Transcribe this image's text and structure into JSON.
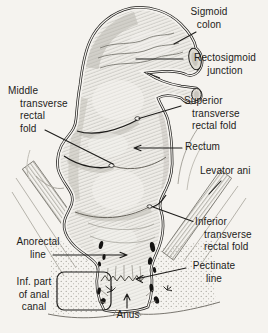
{
  "colors": {
    "background": "#f5f3ef",
    "ink": "#1d1c1a",
    "organ_fill": "#efede8",
    "shade": "#8b887f"
  },
  "labels": {
    "sigmoid_colon": "Sigmoid\ncolon",
    "rectosigmoid_junction": "Rectosigmoid\njunction",
    "middle_transverse_rectal_fold": "Middle\ntransverse\nrectal\nfold",
    "superior_transverse_rectal_fold": "Superior\ntransverse\nrectal fold",
    "rectum": "Rectum",
    "levator_ani": "Levator ani",
    "inferior_transverse_rectal_fold": "Inferior\ntransverse\nrectal fold",
    "anorectal_line": "Anorectal\nline",
    "pectinate_line": "Pectinate\nline",
    "inf_part_of_anal_canal": "Inf. part\nof anal\ncanal",
    "anus": "Anus"
  }
}
